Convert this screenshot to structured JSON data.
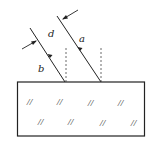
{
  "diagram": {
    "labels": {
      "a": "a",
      "b": "b",
      "d": "d"
    },
    "glass_hatch_mark": "//",
    "colors": {
      "line": "#222222",
      "background": "#ffffff"
    }
  }
}
